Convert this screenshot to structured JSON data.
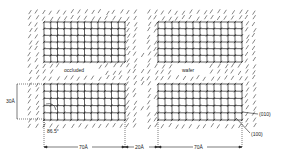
{
  "diagram": {
    "domains": [
      {
        "id": "top-left",
        "x": 44,
        "y": 22,
        "w": 81,
        "h": 40,
        "cols": 12,
        "rows": 6
      },
      {
        "id": "top-right",
        "x": 158,
        "y": 22,
        "w": 84,
        "h": 40,
        "cols": 12,
        "rows": 6
      },
      {
        "id": "bottom-left",
        "x": 44,
        "y": 84,
        "w": 81,
        "h": 36,
        "cols": 12,
        "rows": 5
      },
      {
        "id": "bottom-right",
        "x": 158,
        "y": 84,
        "w": 84,
        "h": 36,
        "cols": 12,
        "rows": 5
      }
    ],
    "labels": {
      "occluded": "occluded",
      "wafer": "wafer",
      "height_dim": "30Å",
      "width_left": "70Å",
      "gap": "20Å",
      "width_right": "70Å",
      "angle": "86.5°",
      "face_010": "(010)",
      "face_100": "(100)"
    },
    "colors": {
      "lattice": "#1a1a1a",
      "hatch": "#333333",
      "dim_line": "#222222"
    }
  }
}
